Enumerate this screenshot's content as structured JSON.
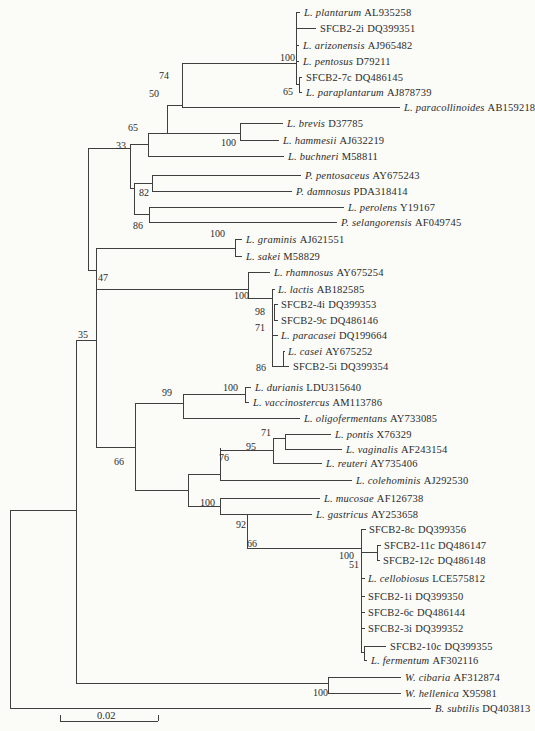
{
  "figure": {
    "type": "phylogenetic-tree",
    "line_color": "#3f3f3f",
    "text_color": "#2b2b2b",
    "background": "#fbfbf8"
  },
  "scale_bar": {
    "label": "0.02",
    "x1": 60,
    "x2": 158,
    "y": 721,
    "tick_h": 6,
    "label_x": 97,
    "label_y": 710
  },
  "leaves": [
    {
      "n": "L. plantarum",
      "it": true,
      "acc": "AL935258",
      "x": 304,
      "y": 12
    },
    {
      "n": "SFCB2-2i",
      "it": false,
      "acc": "DQ399351",
      "x": 320,
      "y": 28
    },
    {
      "n": "L. arizonensis",
      "it": true,
      "acc": "AJ965482",
      "x": 303,
      "y": 45
    },
    {
      "n": "L. pentosus",
      "it": true,
      "acc": "D79211",
      "x": 303,
      "y": 61
    },
    {
      "n": "SFCB2-7c",
      "it": false,
      "acc": "DQ486145",
      "x": 306,
      "y": 77
    },
    {
      "n": "L. paraplantarum",
      "it": true,
      "acc": "AJ878739",
      "x": 306,
      "y": 92
    },
    {
      "n": "L. paracollinoides",
      "it": true,
      "acc": "AB159218",
      "x": 404,
      "y": 107
    },
    {
      "n": "L. brevis",
      "it": true,
      "acc": "D37785",
      "x": 287,
      "y": 123
    },
    {
      "n": "L. hammesii",
      "it": true,
      "acc": "AJ632219",
      "x": 283,
      "y": 140
    },
    {
      "n": "L. buchneri",
      "it": true,
      "acc": "M58811",
      "x": 288,
      "y": 156
    },
    {
      "n": "P. pentosaceus",
      "it": true,
      "acc": "AY675243",
      "x": 305,
      "y": 175
    },
    {
      "n": "P. damnosus",
      "it": true,
      "acc": "PDA318414",
      "x": 296,
      "y": 191
    },
    {
      "n": "L. perolens",
      "it": true,
      "acc": "Y19167",
      "x": 348,
      "y": 207
    },
    {
      "n": "P. selangorensis",
      "it": true,
      "acc": "AF049745",
      "x": 341,
      "y": 222
    },
    {
      "n": "L. graminis",
      "it": true,
      "acc": "AJ621551",
      "x": 246,
      "y": 239
    },
    {
      "n": "L. sakei",
      "it": true,
      "acc": "M58829",
      "x": 246,
      "y": 256
    },
    {
      "n": "L. rhamnosus",
      "it": true,
      "acc": "AY675254",
      "x": 274,
      "y": 272
    },
    {
      "n": "L. lactis",
      "it": true,
      "acc": "AB182585",
      "x": 278,
      "y": 289
    },
    {
      "n": "SFCB2-4i",
      "it": false,
      "acc": "DQ399353",
      "x": 281,
      "y": 304
    },
    {
      "n": "SFCB2-9c",
      "it": false,
      "acc": "DQ486146",
      "x": 281,
      "y": 320
    },
    {
      "n": "L. paracasei",
      "it": true,
      "acc": "DQ199664",
      "x": 281,
      "y": 335
    },
    {
      "n": "L. casei",
      "it": true,
      "acc": "AY675252",
      "x": 288,
      "y": 351
    },
    {
      "n": "SFCB2-5i",
      "it": false,
      "acc": "DQ399354",
      "x": 293,
      "y": 366
    },
    {
      "n": "L. durianis",
      "it": true,
      "acc": "LDU315640",
      "x": 255,
      "y": 387
    },
    {
      "n": "L. vaccinostercus",
      "it": true,
      "acc": "AM113786",
      "x": 253,
      "y": 402
    },
    {
      "n": "L. oligofermentans",
      "it": true,
      "acc": "AY733085",
      "x": 304,
      "y": 418
    },
    {
      "n": "L. pontis",
      "it": true,
      "acc": "X76329",
      "x": 335,
      "y": 434
    },
    {
      "n": "L. vaginalis",
      "it": true,
      "acc": "AF243154",
      "x": 346,
      "y": 449
    },
    {
      "n": "L. reuteri",
      "it": true,
      "acc": "AY735406",
      "x": 326,
      "y": 463
    },
    {
      "n": "L. colehominis",
      "it": true,
      "acc": "AJ292530",
      "x": 356,
      "y": 480
    },
    {
      "n": "L. mucosae",
      "it": true,
      "acc": "AF126738",
      "x": 324,
      "y": 498
    },
    {
      "n": "L. gastricus",
      "it": true,
      "acc": "AY253658",
      "x": 316,
      "y": 514
    },
    {
      "n": "SFCB2-8c",
      "it": false,
      "acc": "DQ399356",
      "x": 369,
      "y": 529
    },
    {
      "n": "SFCB2-11c",
      "it": false,
      "acc": "DQ486147",
      "x": 384,
      "y": 545
    },
    {
      "n": "SFCB2-12c",
      "it": false,
      "acc": "DQ486148",
      "x": 383,
      "y": 560
    },
    {
      "n": "L. cellobiosus",
      "it": true,
      "acc": "LCE575812",
      "x": 368,
      "y": 578
    },
    {
      "n": "SFCB2-1i",
      "it": false,
      "acc": "DQ399350",
      "x": 368,
      "y": 596
    },
    {
      "n": "SFCB2-6c",
      "it": false,
      "acc": "DQ486144",
      "x": 368,
      "y": 612
    },
    {
      "n": "SFCB2-3i",
      "it": false,
      "acc": "DQ399352",
      "x": 368,
      "y": 628
    },
    {
      "n": "SFCB2-10c",
      "it": false,
      "acc": "DQ399355",
      "x": 390,
      "y": 646
    },
    {
      "n": "L. fermentum",
      "it": true,
      "acc": "AF302116",
      "x": 371,
      "y": 660
    },
    {
      "n": "W. cibaria",
      "it": true,
      "acc": "AF312874",
      "x": 405,
      "y": 677
    },
    {
      "n": "W. hellenica",
      "it": true,
      "acc": "X95981",
      "x": 405,
      "y": 693
    },
    {
      "n": "B. subtilis",
      "it": true,
      "acc": "DQ403813",
      "x": 435,
      "y": 708
    }
  ],
  "bootstraps": [
    {
      "v": "100",
      "x": 280,
      "y": 52
    },
    {
      "v": "65",
      "x": 283,
      "y": 86
    },
    {
      "v": "74",
      "x": 159,
      "y": 70
    },
    {
      "v": "50",
      "x": 149,
      "y": 88
    },
    {
      "v": "65",
      "x": 128,
      "y": 122
    },
    {
      "v": "33",
      "x": 116,
      "y": 140
    },
    {
      "v": "100",
      "x": 221,
      "y": 137
    },
    {
      "v": "82",
      "x": 139,
      "y": 187
    },
    {
      "v": "86",
      "x": 133,
      "y": 220
    },
    {
      "v": "100",
      "x": 210,
      "y": 228
    },
    {
      "v": "47",
      "x": 98,
      "y": 272
    },
    {
      "v": "35",
      "x": 78,
      "y": 329
    },
    {
      "v": "100",
      "x": 234,
      "y": 290
    },
    {
      "v": "98",
      "x": 255,
      "y": 306
    },
    {
      "v": "71",
      "x": 255,
      "y": 322
    },
    {
      "v": "86",
      "x": 256,
      "y": 362
    },
    {
      "v": "99",
      "x": 162,
      "y": 387
    },
    {
      "v": "100",
      "x": 223,
      "y": 382
    },
    {
      "v": "71",
      "x": 261,
      "y": 427
    },
    {
      "v": "95",
      "x": 246,
      "y": 441
    },
    {
      "v": "76",
      "x": 219,
      "y": 452
    },
    {
      "v": "66",
      "x": 114,
      "y": 456
    },
    {
      "v": "100",
      "x": 200,
      "y": 497
    },
    {
      "v": "92",
      "x": 236,
      "y": 519
    },
    {
      "v": "66",
      "x": 247,
      "y": 538
    },
    {
      "v": "100",
      "x": 339,
      "y": 550
    },
    {
      "v": "51",
      "x": 349,
      "y": 559
    },
    {
      "v": "100",
      "x": 313,
      "y": 687
    }
  ],
  "tree_lines": {
    "h": [
      [
        296,
        300,
        12
      ],
      [
        296,
        316,
        28
      ],
      [
        296,
        299,
        45
      ],
      [
        296,
        299,
        61
      ],
      [
        296,
        299,
        84
      ],
      [
        299,
        302,
        77
      ],
      [
        299,
        302,
        92
      ],
      [
        182,
        296,
        63
      ],
      [
        182,
        400,
        107
      ],
      [
        167,
        182,
        105
      ],
      [
        148,
        240,
        133
      ],
      [
        240,
        283,
        123
      ],
      [
        240,
        279,
        140
      ],
      [
        148,
        284,
        156
      ],
      [
        88,
        130,
        148
      ],
      [
        130,
        148,
        144
      ],
      [
        130,
        134,
        188
      ],
      [
        134,
        152,
        183
      ],
      [
        152,
        301,
        175
      ],
      [
        152,
        292,
        191
      ],
      [
        134,
        149,
        214
      ],
      [
        149,
        344,
        207
      ],
      [
        149,
        337,
        222
      ],
      [
        88,
        96,
        270
      ],
      [
        96,
        235,
        248
      ],
      [
        235,
        242,
        239
      ],
      [
        235,
        242,
        256
      ],
      [
        96,
        248,
        289
      ],
      [
        248,
        270,
        272
      ],
      [
        248,
        272,
        298
      ],
      [
        272,
        275,
        289
      ],
      [
        274,
        278,
        304
      ],
      [
        274,
        278,
        320
      ],
      [
        272,
        278,
        335
      ],
      [
        272,
        289,
        366
      ],
      [
        283,
        285,
        351
      ],
      [
        76,
        96,
        340
      ],
      [
        96,
        135,
        447
      ],
      [
        135,
        183,
        403
      ],
      [
        183,
        245,
        394
      ],
      [
        245,
        251,
        387
      ],
      [
        245,
        249,
        402
      ],
      [
        183,
        300,
        418
      ],
      [
        135,
        188,
        490
      ],
      [
        188,
        220,
        474
      ],
      [
        220,
        273,
        450
      ],
      [
        273,
        285,
        438
      ],
      [
        285,
        331,
        434
      ],
      [
        285,
        342,
        449
      ],
      [
        273,
        322,
        463
      ],
      [
        220,
        352,
        480
      ],
      [
        188,
        220,
        506
      ],
      [
        220,
        320,
        498
      ],
      [
        220,
        247,
        514
      ],
      [
        247,
        312,
        514
      ],
      [
        247,
        361,
        548
      ],
      [
        361,
        366,
        529
      ],
      [
        361,
        377,
        552
      ],
      [
        377,
        381,
        545
      ],
      [
        377,
        380,
        560
      ],
      [
        361,
        365,
        578
      ],
      [
        361,
        365,
        596
      ],
      [
        361,
        365,
        612
      ],
      [
        361,
        365,
        628
      ],
      [
        361,
        364,
        652
      ],
      [
        364,
        386,
        646
      ],
      [
        364,
        367,
        660
      ],
      [
        10,
        76,
        510
      ],
      [
        76,
        328,
        683
      ],
      [
        328,
        401,
        677
      ],
      [
        328,
        401,
        693
      ],
      [
        10,
        431,
        708
      ]
    ],
    "v": [
      [
        296,
        12,
        84
      ],
      [
        299,
        77,
        92
      ],
      [
        182,
        63,
        107
      ],
      [
        167,
        105,
        133
      ],
      [
        240,
        123,
        140
      ],
      [
        148,
        133,
        156
      ],
      [
        130,
        144,
        188
      ],
      [
        134,
        183,
        214
      ],
      [
        152,
        175,
        191
      ],
      [
        149,
        207,
        222
      ],
      [
        88,
        148,
        270
      ],
      [
        96,
        248,
        447
      ],
      [
        235,
        239,
        256
      ],
      [
        248,
        272,
        298
      ],
      [
        272,
        289,
        366
      ],
      [
        274,
        304,
        320
      ],
      [
        283,
        351,
        366
      ],
      [
        76,
        340,
        683
      ],
      [
        135,
        403,
        490
      ],
      [
        183,
        394,
        418
      ],
      [
        245,
        387,
        402
      ],
      [
        188,
        474,
        506
      ],
      [
        220,
        448,
        480
      ],
      [
        273,
        438,
        463
      ],
      [
        285,
        434,
        449
      ],
      [
        220,
        498,
        514
      ],
      [
        247,
        514,
        548
      ],
      [
        361,
        529,
        652
      ],
      [
        377,
        545,
        560
      ],
      [
        364,
        646,
        660
      ],
      [
        328,
        677,
        693
      ],
      [
        10,
        510,
        708
      ]
    ]
  }
}
